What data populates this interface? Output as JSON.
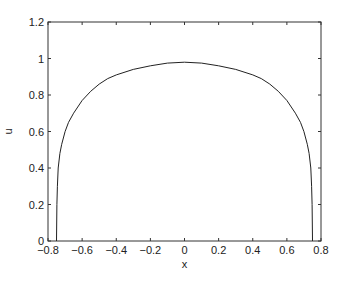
{
  "chart_data": {
    "type": "line",
    "title": "",
    "xlabel": "x",
    "ylabel": "u",
    "xlim": [
      -0.8,
      0.8
    ],
    "ylim": [
      0,
      1.2
    ],
    "xticks": [
      "-0.8",
      "-0.6",
      "-0.4",
      "-0.2",
      "0",
      "0.2",
      "0.4",
      "0.6",
      "0.8"
    ],
    "yticks": [
      "0",
      "0.2",
      "0.4",
      "0.6",
      "0.8",
      "1",
      "1.2"
    ],
    "grid": false,
    "series": [
      {
        "name": "u(x)",
        "color": "#222222",
        "x": [
          -0.75,
          -0.748,
          -0.745,
          -0.74,
          -0.73,
          -0.72,
          -0.7,
          -0.68,
          -0.65,
          -0.6,
          -0.55,
          -0.5,
          -0.45,
          -0.4,
          -0.3,
          -0.2,
          -0.1,
          0,
          0.1,
          0.2,
          0.3,
          0.4,
          0.45,
          0.5,
          0.55,
          0.6,
          0.65,
          0.68,
          0.7,
          0.72,
          0.73,
          0.74,
          0.745,
          0.748,
          0.75
        ],
        "y": [
          0,
          0.2,
          0.3,
          0.4,
          0.48,
          0.53,
          0.6,
          0.65,
          0.7,
          0.77,
          0.82,
          0.86,
          0.89,
          0.91,
          0.94,
          0.96,
          0.975,
          0.98,
          0.975,
          0.96,
          0.94,
          0.91,
          0.89,
          0.86,
          0.82,
          0.77,
          0.7,
          0.65,
          0.6,
          0.53,
          0.48,
          0.4,
          0.3,
          0.2,
          0
        ]
      }
    ]
  }
}
